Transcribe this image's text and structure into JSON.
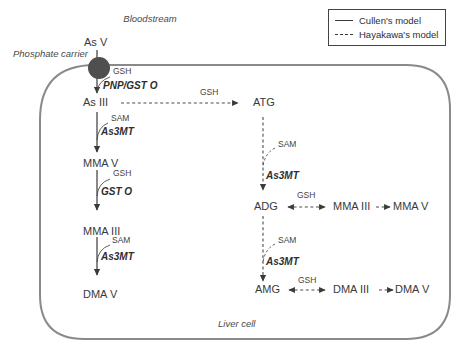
{
  "legend": {
    "items": [
      {
        "label": "Cullen's model",
        "line_style": "solid"
      },
      {
        "label": "Hayakawa's model",
        "line_style": "dashed"
      }
    ]
  },
  "compartments": {
    "bloodstream": "Bloodstream",
    "liver_cell": "Liver cell"
  },
  "transporter": {
    "label": "Phosphate carrier"
  },
  "nodes": {
    "as_v": "As V",
    "as_iii": "As III",
    "mma_v": "MMA V",
    "mma_iii": "MMA III",
    "dma_v": "DMA V",
    "atg": "ATG",
    "adg": "ADG",
    "amg": "AMG",
    "dma_iii": "DMA III"
  },
  "enzymes": {
    "pnp_gst_o": "PNP/GST O",
    "as3mt": "As3MT",
    "gst_o": "GST O"
  },
  "cofactors": {
    "gsh": "GSH",
    "sam": "SAM"
  },
  "colors": {
    "membrane": "#8a8a8a",
    "carrier_fill": "#4f4f4f",
    "text": "#3a3a3a",
    "solid_arrow": "#3a3a3a",
    "dashed_arrow": "#4d4d4d",
    "background": "#ffffff"
  }
}
